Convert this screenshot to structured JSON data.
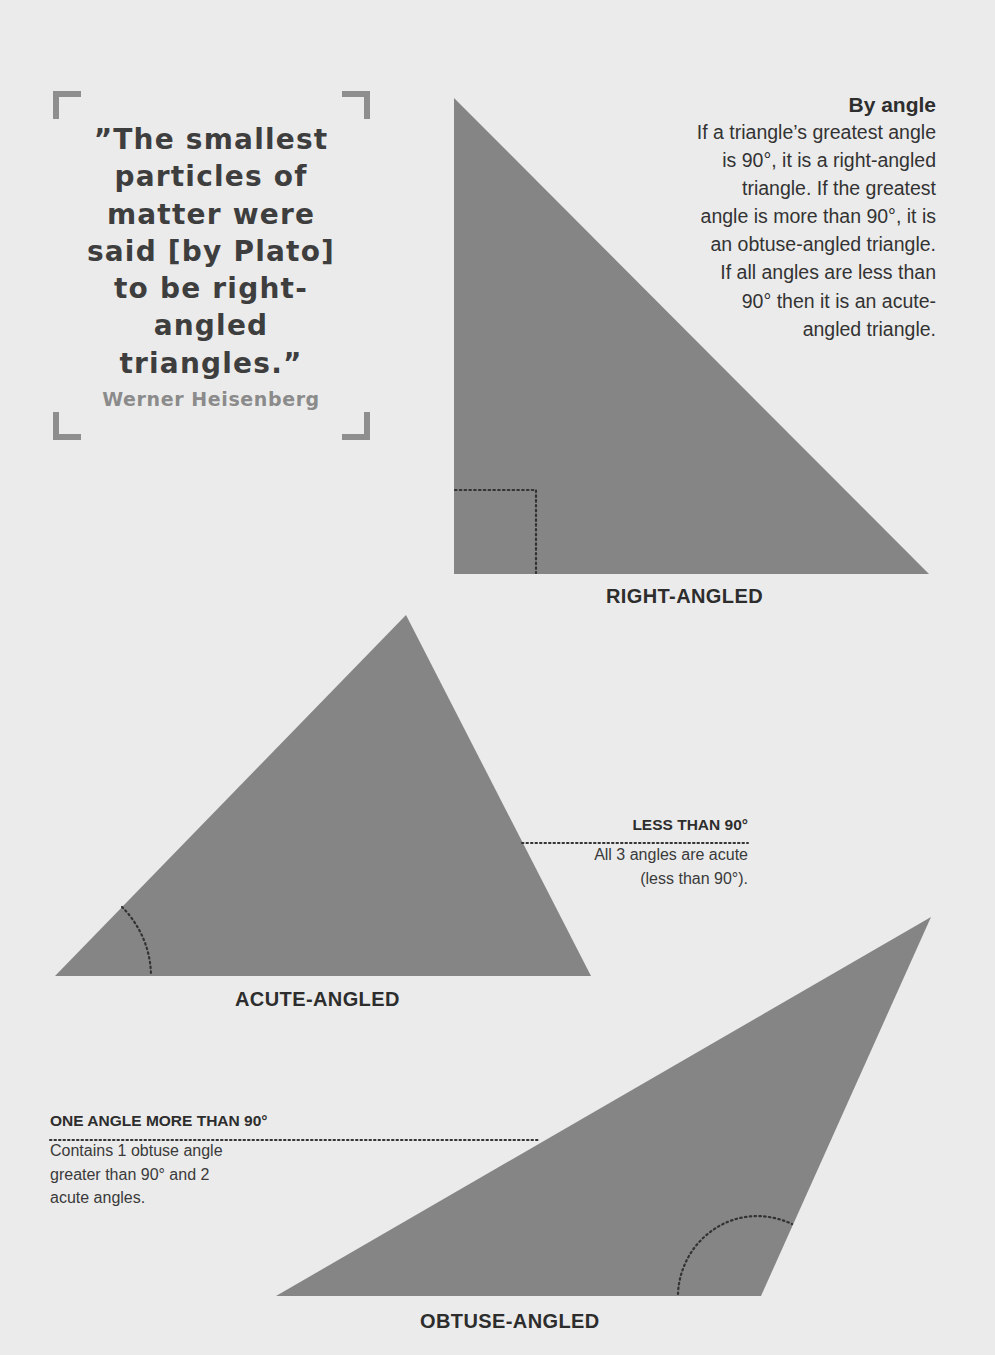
{
  "quote": {
    "text": "“The smallest particles of matter were said [by Plato] to be right-angled triangles.”",
    "lines": [
      "”The smallest",
      "particles of",
      "matter were",
      "said [by Plato]",
      "to be right-",
      "angled",
      "triangles.”"
    ],
    "author": "Werner Heisenberg"
  },
  "by_angle": {
    "title": "By angle",
    "body_lines": [
      "If a triangle’s greatest angle",
      "is 90°, it is a right-angled",
      "triangle. If the greatest",
      "angle is more than 90°, it is",
      "an obtuse-angled triangle.",
      "If all angles are less than",
      "90° then it is an acute-",
      "angled triangle."
    ]
  },
  "triangles": {
    "right": {
      "label": "RIGHT-ANGLED",
      "points": "454,98 454,574 929,574",
      "marker": "right-angle-square"
    },
    "acute": {
      "label": "ACUTE-ANGLED",
      "points": "55,976 406,615 591,976",
      "callout": {
        "heading": "LESS THAN 90°",
        "body_lines": [
          "All 3 angles are acute",
          "(less than 90°)."
        ]
      }
    },
    "obtuse": {
      "label": "OBTUSE-ANGLED",
      "points": "276,1296 931,917 761,1296",
      "callout": {
        "heading": "ONE ANGLE MORE THAN 90°",
        "body_lines": [
          "Contains 1 obtuse angle",
          "greater than 90° and 2",
          "acute angles."
        ]
      }
    }
  },
  "colors": {
    "background": "#ebebeb",
    "triangle_fill": "#858585",
    "marker": "#333333",
    "bracket": "#8e8e8e"
  }
}
